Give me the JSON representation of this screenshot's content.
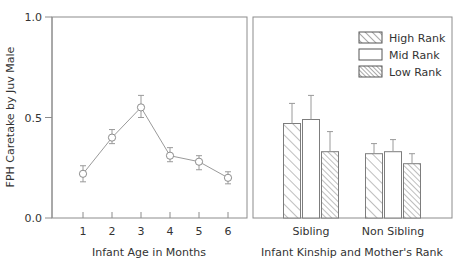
{
  "chart_data": {
    "type": "line",
    "title": "",
    "ylabel": "FPH Caretake by Juv Male",
    "ylim": [
      0.0,
      1.0
    ],
    "yticks": [
      0.0,
      0.5,
      1.0
    ],
    "ytick_labels": [
      "0.0",
      "0.5",
      "1.0"
    ],
    "grid": false,
    "legend_position": "top-right of second panel",
    "panels": [
      {
        "name": "left-panel",
        "type": "line",
        "xlabel": "Infant Age in Months",
        "categories": [
          "1",
          "2",
          "3",
          "4",
          "5",
          "6"
        ],
        "x": [
          1,
          2,
          3,
          4,
          5,
          6
        ],
        "values": [
          0.22,
          0.4,
          0.55,
          0.31,
          0.28,
          0.2
        ],
        "err_low": [
          0.04,
          0.03,
          0.05,
          0.03,
          0.04,
          0.03
        ],
        "err_high": [
          0.04,
          0.04,
          0.06,
          0.04,
          0.03,
          0.03
        ],
        "marker": "open-circle"
      },
      {
        "name": "right-panel",
        "type": "bar",
        "xlabel": "Infant Kinship and Mother's Rank",
        "categories": [
          "Sibling",
          "Non Sibling"
        ],
        "series": [
          {
            "name": "High Rank",
            "pattern": "wide-hatch",
            "values": [
              0.47,
              0.32
            ],
            "err_high": [
              0.1,
              0.05
            ],
            "err_low": [
              0.1,
              0.05
            ]
          },
          {
            "name": "Mid Rank",
            "pattern": "none",
            "values": [
              0.49,
              0.33
            ],
            "err_high": [
              0.12,
              0.06
            ],
            "err_low": [
              0.12,
              0.06
            ]
          },
          {
            "name": "Low Rank",
            "pattern": "dense-hatch",
            "values": [
              0.33,
              0.27
            ],
            "err_high": [
              0.1,
              0.05
            ],
            "err_low": [
              0.1,
              0.05
            ]
          }
        ]
      }
    ],
    "legend": [
      {
        "label": "High Rank",
        "pattern": "wide-hatch"
      },
      {
        "label": "Mid Rank",
        "pattern": "none"
      },
      {
        "label": "Low Rank",
        "pattern": "dense-hatch"
      }
    ],
    "colors": {
      "axis": "#8c8c8c",
      "bar_stroke": "#7d7d7d",
      "bar_fill": "#ffffff",
      "line": "#9a9a9a",
      "text": "#333333",
      "background": "#ffffff"
    }
  },
  "axis": {
    "y_label": "FPH Caretake by Juv Male",
    "y_tick_1": "1.0",
    "y_tick_2": "0.5",
    "y_tick_3": "0.0",
    "left_x_label": "Infant Age in Months",
    "right_x_label": "Infant Kinship and Mother's Rank",
    "left_ticks": [
      "1",
      "2",
      "3",
      "4",
      "5",
      "6"
    ],
    "right_ticks": [
      "Sibling",
      "Non Sibling"
    ]
  },
  "legend": {
    "items": [
      {
        "label": "High Rank"
      },
      {
        "label": "Mid Rank"
      },
      {
        "label": "Low Rank"
      }
    ]
  }
}
